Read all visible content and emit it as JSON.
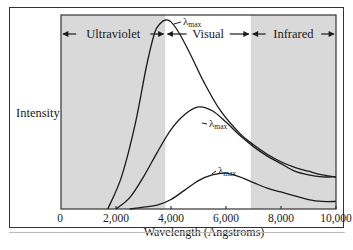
{
  "chart_data": {
    "type": "line",
    "title": "",
    "xlabel": "Wavelength (Angstroms)",
    "ylabel": "Intensity",
    "xlim": [
      0,
      10000
    ],
    "ylim": [
      0,
      1
    ],
    "x_ticks": [
      0,
      2000,
      4000,
      6000,
      8000,
      10000
    ],
    "x_tick_labels": [
      "0",
      "2,000",
      "4,000",
      "6,000",
      "8,000",
      "10,000"
    ],
    "y_ticks": [],
    "grid": false,
    "legend": null,
    "regions": [
      {
        "name": "Ultraviolet",
        "x_start": 0,
        "x_end": 3800,
        "shaded": true
      },
      {
        "name": "Visual",
        "x_start": 3800,
        "x_end": 6900,
        "shaded": false
      },
      {
        "name": "Infrared",
        "x_start": 6900,
        "x_end": 10000,
        "shaded": true
      }
    ],
    "annotations": [
      {
        "text": "λmax",
        "series": "hot",
        "x": 4000
      },
      {
        "text": "λmax",
        "series": "medium",
        "x": 5200
      },
      {
        "text": "λmax",
        "series": "cool",
        "x": 6000
      }
    ],
    "series": [
      {
        "name": "hot",
        "peak_wavelength": 4000,
        "x": [
          1700,
          2200,
          2700,
          3100,
          3400,
          3600,
          3800,
          4000,
          4300,
          4700,
          5200,
          5800,
          6500,
          7000,
          7500,
          8000,
          8500,
          9000,
          9500,
          10000
        ],
        "values": [
          0.0,
          0.17,
          0.45,
          0.75,
          0.93,
          0.98,
          1.0,
          0.99,
          0.93,
          0.82,
          0.67,
          0.52,
          0.4,
          0.34,
          0.29,
          0.25,
          0.22,
          0.2,
          0.18,
          0.17
        ]
      },
      {
        "name": "medium",
        "peak_wavelength": 5200,
        "x": [
          2000,
          2500,
          3000,
          3500,
          4000,
          4500,
          5000,
          5500,
          6000,
          6500,
          7000,
          7500,
          8000,
          8500,
          9000,
          9500,
          10000
        ],
        "values": [
          0.0,
          0.06,
          0.17,
          0.3,
          0.42,
          0.5,
          0.54,
          0.52,
          0.46,
          0.39,
          0.33,
          0.28,
          0.24,
          0.2,
          0.18,
          0.17,
          0.17
        ]
      },
      {
        "name": "cool",
        "peak_wavelength": 6000,
        "x": [
          2500,
          3000,
          3500,
          4000,
          4500,
          5000,
          5500,
          6000,
          6500,
          7000,
          7500,
          8000,
          8500,
          9000,
          9500,
          10000
        ],
        "values": [
          0.0,
          0.01,
          0.02,
          0.05,
          0.1,
          0.15,
          0.18,
          0.19,
          0.17,
          0.14,
          0.11,
          0.09,
          0.07,
          0.05,
          0.04,
          0.04
        ]
      }
    ]
  },
  "colors": {
    "shade": "#d9d9d9",
    "line": "#1a1a1a",
    "frame": "#333333"
  },
  "labels": {
    "ylabel": "Intensity",
    "xlabel": "Wavelength (Angstroms)",
    "lambda": "λ",
    "lambda_sub": "max"
  }
}
